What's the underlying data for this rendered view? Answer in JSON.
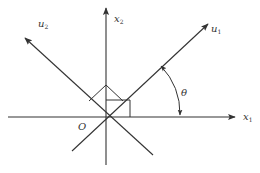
{
  "diagram": {
    "type": "coordinate-rotation",
    "colors": {
      "line": "#333333",
      "background": "#ffffff"
    },
    "origin": {
      "label": "O",
      "x": 106,
      "y": 117
    },
    "axes": [
      {
        "id": "x1",
        "label_base": "x",
        "label_sub": "1",
        "from": [
          8,
          117
        ],
        "to": [
          235,
          117
        ],
        "arrow": true
      },
      {
        "id": "x2",
        "label_base": "x",
        "label_sub": "2",
        "from": [
          106,
          165
        ],
        "to": [
          106,
          8
        ],
        "arrow": true
      },
      {
        "id": "u1",
        "label_base": "u",
        "label_sub": "1",
        "from": [
          72,
          151
        ],
        "to": [
          208,
          24
        ],
        "arrow": true
      },
      {
        "id": "u2",
        "label_base": "u",
        "label_sub": "2",
        "from": [
          153,
          155
        ],
        "to": [
          25,
          38
        ],
        "arrow": true
      }
    ],
    "angle": {
      "label": "θ",
      "between": [
        "x1",
        "u1"
      ]
    },
    "right_angle_markers": [
      {
        "between": [
          "x1",
          "x2"
        ]
      },
      {
        "between": [
          "u1",
          "u2"
        ]
      }
    ]
  }
}
